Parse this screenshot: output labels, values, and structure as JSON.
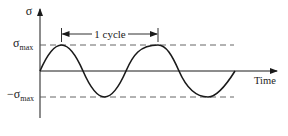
{
  "diagram": {
    "type": "sinusoidal-stress-cycle",
    "y_axis_label": "σ",
    "y_max_label": {
      "main": "σ",
      "sub": "max"
    },
    "y_min_label": {
      "prefix": "−σ",
      "sub": "max"
    },
    "x_axis_label": "Time",
    "cycle_label": "1 cycle",
    "colors": {
      "line": "#1a1a1a",
      "dash": "#555555",
      "background": "#ffffff"
    }
  }
}
